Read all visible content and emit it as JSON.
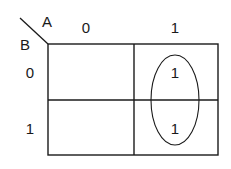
{
  "diagram": {
    "type": "karnaugh-map",
    "variables": {
      "column": "A",
      "row": "B"
    },
    "column_labels": [
      "0",
      "1"
    ],
    "row_labels": [
      "0",
      "1"
    ],
    "cells": [
      [
        "",
        "1"
      ],
      [
        "",
        "1"
      ]
    ],
    "groups": [
      {
        "shape": "ellipse",
        "covers": "column A=1, rows B=0 and B=1"
      }
    ],
    "colors": {
      "line": "#1a1a1a",
      "background": "#ffffff"
    }
  }
}
